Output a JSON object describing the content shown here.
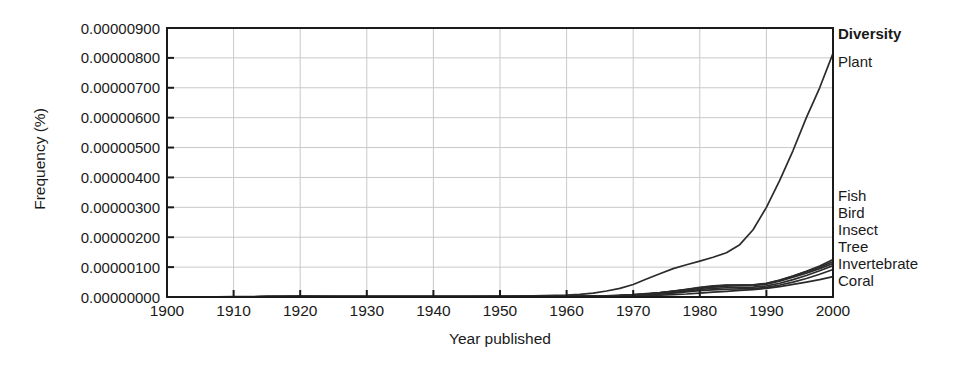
{
  "chart_data": {
    "type": "line",
    "title": "",
    "xlabel": "Year published",
    "ylabel": "Frequency (%)",
    "xlim": [
      1900,
      2000
    ],
    "ylim": [
      0.0,
      9e-06
    ],
    "grid": true,
    "legend_position": "right-inline",
    "legend_title": "Diversity",
    "x_ticks": [
      "1900",
      "1910",
      "1920",
      "1930",
      "1940",
      "1950",
      "1960",
      "1970",
      "1980",
      "1990",
      "2000"
    ],
    "y_ticks": [
      "0.00000000",
      "0.00000100",
      "0.00000200",
      "0.00000300",
      "0.00000400",
      "0.00000500",
      "0.00000600",
      "0.00000700",
      "0.00000800",
      "0.00000900"
    ],
    "x": [
      1900,
      1905,
      1910,
      1915,
      1920,
      1925,
      1930,
      1935,
      1940,
      1945,
      1950,
      1955,
      1960,
      1962,
      1964,
      1966,
      1968,
      1970,
      1972,
      1974,
      1976,
      1978,
      1980,
      1982,
      1984,
      1986,
      1988,
      1990,
      1992,
      1994,
      1996,
      1998,
      2000
    ],
    "series": [
      {
        "name": "Plant",
        "values": [
          0.0,
          0.0,
          1e-08,
          2e-08,
          3e-08,
          2e-08,
          2e-08,
          2e-08,
          2e-08,
          2e-08,
          3e-08,
          4e-08,
          6e-08,
          9e-08,
          1.3e-07,
          2e-07,
          2.9e-07,
          4.2e-07,
          6e-07,
          7.8e-07,
          9.5e-07,
          1.08e-06,
          1.2e-06,
          1.33e-06,
          1.48e-06,
          1.75e-06,
          2.25e-06,
          3e-06,
          3.9e-06,
          4.9e-06,
          6e-06,
          7e-06,
          8.15e-06
        ]
      },
      {
        "name": "Fish",
        "values": [
          0.0,
          0.0,
          0.0,
          1e-08,
          1e-08,
          1e-08,
          1e-08,
          1e-08,
          1e-08,
          1e-08,
          1e-08,
          1e-08,
          2e-08,
          2e-08,
          3e-08,
          4e-08,
          5e-08,
          7e-08,
          1e-07,
          1.4e-07,
          1.9e-07,
          2.4e-07,
          2.9e-07,
          3.3e-07,
          3.6e-07,
          3.8e-07,
          4e-07,
          4.5e-07,
          5.6e-07,
          7e-07,
          8.6e-07,
          1.04e-06,
          1.25e-06
        ]
      },
      {
        "name": "Bird",
        "values": [
          0.0,
          0.0,
          0.0,
          1e-08,
          1e-08,
          1e-08,
          1e-08,
          1e-08,
          1e-08,
          1e-08,
          1e-08,
          1e-08,
          2e-08,
          2e-08,
          3e-08,
          4e-08,
          5e-08,
          7e-08,
          1e-07,
          1.4e-07,
          1.9e-07,
          2.5e-07,
          3.1e-07,
          3.6e-07,
          3.9e-07,
          4e-07,
          4.1e-07,
          4.6e-07,
          5.7e-07,
          7e-07,
          8.5e-07,
          1e-06,
          1.18e-06
        ]
      },
      {
        "name": "Insect",
        "values": [
          0.0,
          0.0,
          0.0,
          1e-08,
          2e-08,
          1e-08,
          1e-08,
          1e-08,
          1e-08,
          1e-08,
          1e-08,
          2e-08,
          2e-08,
          3e-08,
          3e-08,
          4e-08,
          6e-08,
          8e-08,
          1.1e-07,
          1.5e-07,
          2e-07,
          2.6e-07,
          3.2e-07,
          3.7e-07,
          4e-07,
          4e-07,
          3.9e-07,
          4.3e-07,
          5.3e-07,
          6.6e-07,
          8e-07,
          9.5e-07,
          1.12e-06
        ]
      },
      {
        "name": "Tree",
        "values": [
          0.0,
          0.0,
          0.0,
          1e-08,
          1e-08,
          1e-08,
          1e-08,
          1e-08,
          1e-08,
          1e-08,
          1e-08,
          1e-08,
          2e-08,
          2e-08,
          2e-08,
          3e-08,
          4e-08,
          6e-08,
          8e-08,
          1.1e-07,
          1.5e-07,
          2e-07,
          2.5e-07,
          2.9e-07,
          3.1e-07,
          3.2e-07,
          3.3e-07,
          3.7e-07,
          4.6e-07,
          5.8e-07,
          7.2e-07,
          8.8e-07,
          1.05e-06
        ]
      },
      {
        "name": "Invertebrate",
        "values": [
          0.0,
          0.0,
          0.0,
          0.0,
          1e-08,
          1e-08,
          1e-08,
          1e-08,
          1e-08,
          1e-08,
          1e-08,
          1e-08,
          1e-08,
          2e-08,
          2e-08,
          3e-08,
          4e-08,
          5e-08,
          7e-08,
          1e-07,
          1.3e-07,
          1.7e-07,
          2.1e-07,
          2.4e-07,
          2.6e-07,
          2.7e-07,
          2.8e-07,
          3.2e-07,
          4e-07,
          5e-07,
          6.2e-07,
          7.6e-07,
          9.2e-07
        ]
      },
      {
        "name": "Coral",
        "values": [
          0.0,
          0.0,
          0.0,
          0.0,
          0.0,
          0.0,
          0.0,
          0.0,
          0.0,
          0.0,
          0.0,
          1e-08,
          1e-08,
          1e-08,
          1e-08,
          2e-08,
          2e-08,
          3e-08,
          4e-08,
          6e-08,
          8e-08,
          1e-07,
          1.3e-07,
          1.6e-07,
          1.9e-07,
          2.2e-07,
          2.5e-07,
          2.9e-07,
          3.5e-07,
          4.2e-07,
          5e-07,
          5.8e-07,
          6.8e-07
        ]
      }
    ],
    "colors": {
      "line": "#2b2b2b",
      "grid": "#c9c9c9",
      "axis": "#1a1a1a",
      "background": "#ffffff"
    }
  },
  "legend": {
    "title": "Diversity",
    "entries": [
      {
        "label": "Plant"
      },
      {
        "label": "Fish"
      },
      {
        "label": "Bird"
      },
      {
        "label": "Insect"
      },
      {
        "label": "Tree"
      },
      {
        "label": "Invertebrate"
      },
      {
        "label": "Coral"
      }
    ]
  }
}
